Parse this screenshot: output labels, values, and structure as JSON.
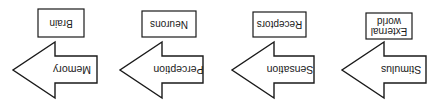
{
  "orientation": "rotated-180",
  "colors": {
    "stroke": "#1a1a1a",
    "fill": "#ffffff",
    "text": "#1a1a1a"
  },
  "diagram": {
    "flow_direction": "left-to-right (as read upright)",
    "steps": [
      {
        "arrow_label": "Stimulus",
        "box_label_lines": [
          "External",
          "world"
        ]
      },
      {
        "arrow_label": "Sensation",
        "box_label_lines": [
          "Receptors"
        ]
      },
      {
        "arrow_label": "Perception",
        "box_label_lines": [
          "Neurons"
        ]
      },
      {
        "arrow_label": "Memory",
        "box_label_lines": [
          "Brain"
        ]
      }
    ]
  }
}
